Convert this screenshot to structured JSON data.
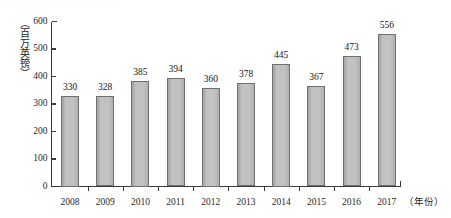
{
  "top_clip_artifact": "· · ·  ·· ·  · ·· · ·  ·· ·  ·",
  "axis": {
    "y_unit_label": "（百万英镑）",
    "x_unit_label": "（年份）",
    "y_ticks": [
      "0",
      "100",
      "200",
      "300",
      "400",
      "500",
      "600"
    ],
    "x_ticks": [
      "2008",
      "2009",
      "2010",
      "2011",
      "2012",
      "2013",
      "2014",
      "2015",
      "2016",
      "2017"
    ]
  },
  "chart_data": {
    "type": "bar",
    "title": "",
    "subtitle": "",
    "xlabel": "（年份）",
    "ylabel": "（百万英镑）",
    "categories": [
      "2008",
      "2009",
      "2010",
      "2011",
      "2012",
      "2013",
      "2014",
      "2015",
      "2016",
      "2017"
    ],
    "values": [
      330,
      328,
      385,
      394,
      360,
      378,
      445,
      367,
      473,
      556
    ],
    "data_labels": [
      "330",
      "328",
      "385",
      "394",
      "360",
      "378",
      "445",
      "367",
      "473",
      "556"
    ],
    "ylim": [
      0,
      600
    ],
    "ytick_step": 100,
    "grid": false,
    "legend": false,
    "bar_fill_color": "#b9b9b9",
    "bar_border_color": "#6f6f6f",
    "axis_color": "#3a3a3a"
  }
}
